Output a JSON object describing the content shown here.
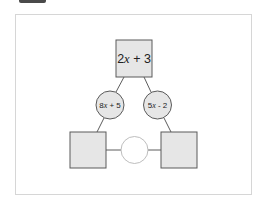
{
  "diagram": {
    "top_box": {
      "label": "2x + 3",
      "label_parts": [
        "2",
        "x",
        " + 3"
      ]
    },
    "left_circle": {
      "label": "8x + 5",
      "label_parts": [
        "8",
        "x",
        " + 5"
      ]
    },
    "right_circle": {
      "label": "5x - 2",
      "label_parts": [
        "5",
        "x",
        " - 2"
      ]
    },
    "bottom_left_box": {
      "label": ""
    },
    "bottom_right_box": {
      "label": ""
    },
    "center_circle": {
      "label": ""
    }
  },
  "colors": {
    "box_fill": "#e6e6e6",
    "box_stroke": "#5a5a5a",
    "circle_empty_fill": "#ffffff",
    "circle_empty_stroke": "#b5b5b5",
    "line": "#4a4a4a",
    "frame_border": "#d6d6d6"
  }
}
